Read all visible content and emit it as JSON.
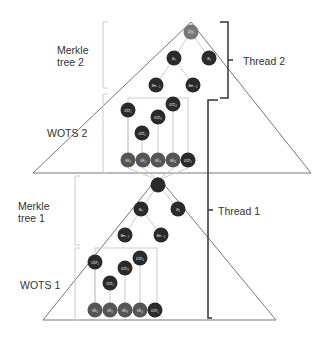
{
  "labels": {
    "merkle2": [
      "Merkle",
      "tree 2"
    ],
    "wots2": "WOTS 2",
    "merkle1": [
      "Merkle",
      "tree 1"
    ],
    "wots1": "WOTS 1",
    "thread2": "Thread 2",
    "thread1": "Thread 1"
  },
  "tree2": {
    "root": "PK",
    "level1": [
      "a₀",
      "a₁"
    ],
    "level2": [
      "aₙ₋₁",
      "aₙ₋₁"
    ],
    "wots_chain": [
      "otz₁",
      "otz₂",
      "otz₃",
      "otz₄"
    ],
    "sk": [
      "sk₁",
      "sk₂",
      "sk₃",
      "sk₄",
      "otz₅"
    ]
  },
  "tree1": {
    "level1": [
      "a₀",
      "a₁"
    ],
    "level2": [
      "aₙ₋₁",
      "aₙ₋₁"
    ],
    "wots_chain": [
      "otz₁",
      "otz₂",
      "otz₃",
      "otz₄"
    ],
    "sk": [
      "sk₁",
      "sk₂",
      "sk₃",
      "sk₄",
      "otz₅"
    ]
  },
  "colors": {
    "node": "#2a2a2a",
    "node_light": "#555555",
    "root_node": "#777777",
    "line": "#666666",
    "faint": "#cccccc"
  }
}
